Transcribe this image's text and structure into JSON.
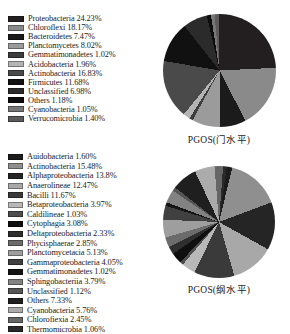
{
  "chart_data": [
    {
      "type": "pie",
      "title": "PGOS(门水平)",
      "categories": [
        "Proteobacteria",
        "Chloroflexi",
        "Bacteroidetes",
        "Planctomycetes",
        "Gemmatimonadetes",
        "Acidobacteria",
        "Actinobacteria",
        "Firmicutes",
        "Unclassified",
        "Others",
        "Cyanobacteria",
        "Verrucomicrobia"
      ],
      "values": [
        24.23,
        18.17,
        7.47,
        8.02,
        1.02,
        1.96,
        16.83,
        11.68,
        6.98,
        1.18,
        1.05,
        1.4
      ],
      "unit": "%",
      "colors": [
        "#231f20",
        "#8a8a8a",
        "#1b1b1b",
        "#9b9b9b",
        "#3d3d3d",
        "#b4b4b4",
        "#4a4a4a",
        "#111111",
        "#2b2b2b",
        "#0d0d0d",
        "#777777",
        "#5a5a5a"
      ],
      "legend_entries": [
        {
          "label": "Proteobacteria 24.23%",
          "color": "#231f20"
        },
        {
          "label": "Chloroflexi 18.17%",
          "color": "#8a8a8a"
        },
        {
          "label": "Bacteroidetes 7.47%",
          "color": "#1b1b1b"
        },
        {
          "label": "Planctomycetes 8.02%",
          "color": "#9b9b9b"
        },
        {
          "label": "Gemmatimonadetes 1.02%",
          "color": "#3d3d3d"
        },
        {
          "label": "Acidobacteria 1.96%",
          "color": "#b4b4b4"
        },
        {
          "label": "Actinobacteria 16.83%",
          "color": "#4a4a4a"
        },
        {
          "label": "Firmicutes 11.68%",
          "color": "#111111"
        },
        {
          "label": "Unclassified 6.98%",
          "color": "#2b2b2b"
        },
        {
          "label": "Others 1.18%",
          "color": "#0d0d0d"
        },
        {
          "label": "Cyanobacteria 1.05%",
          "color": "#777777"
        },
        {
          "label": "Verrucomicrobia 1.40%",
          "color": "#5a5a5a"
        }
      ],
      "legend_position": "left"
    },
    {
      "type": "pie",
      "title": "PGOS(纲水平)",
      "categories": [
        "Auidobacteria",
        "Actinobacteria",
        "Alphaproteobacteria",
        "Anaerolineae",
        "Bacilli",
        "Betaproteobacteria",
        "Caldilineae",
        "Cytophagia",
        "Deltaproteobacteria",
        "Phycisphaerae",
        "Planctomycetacia",
        "Gammaproteobacteria",
        "Gemmatimonadetes",
        "Sphingobacteriia",
        "Unclassified",
        "Others",
        "Cyanobacteria",
        "Chlorofiexia",
        "Thermomicrobia"
      ],
      "values": [
        1.6,
        15.48,
        13.8,
        12.47,
        11.67,
        3.97,
        1.03,
        3.08,
        2.33,
        2.85,
        5.13,
        4.05,
        1.02,
        3.79,
        1.12,
        7.33,
        5.76,
        2.45,
        1.06
      ],
      "unit": "%",
      "colors": [
        "#1c1c1c",
        "#8f8f8f",
        "#252525",
        "#a8a8a8",
        "#3a3a3a",
        "#b8b8b8",
        "#4d4d4d",
        "#0f0f0f",
        "#2e2e2e",
        "#6b6b6b",
        "#9e9e9e",
        "#404040",
        "#141414",
        "#828282",
        "#555555",
        "#1f1f1f",
        "#ababab",
        "#666666",
        "#2a2a2a"
      ],
      "legend_entries": [
        {
          "label": "Auidobacteria 1.60%",
          "color": "#1c1c1c"
        },
        {
          "label": "Actinobacteria 15.48%",
          "color": "#8f8f8f"
        },
        {
          "label": "Alphaproteobacteria 13.8%",
          "color": "#252525"
        },
        {
          "label": "Anaerolineae 12.47%",
          "color": "#a8a8a8"
        },
        {
          "label": "Bacilli 11.67%",
          "color": "#3a3a3a"
        },
        {
          "label": "Betaproteobacteria 3.97%",
          "color": "#b8b8b8"
        },
        {
          "label": "Caldilineae 1.03%",
          "color": "#4d4d4d"
        },
        {
          "label": "Cytophagia 3.08%",
          "color": "#0f0f0f"
        },
        {
          "label": "Deltaproteobacteria 2.33%",
          "color": "#2e2e2e"
        },
        {
          "label": "Phycisphaerae 2.85%",
          "color": "#6b6b6b"
        },
        {
          "label": "Planctomycetacia 5.13%",
          "color": "#9e9e9e"
        },
        {
          "label": "Gammaproteobacteria 4.05%",
          "color": "#404040"
        },
        {
          "label": "Gemmatimonadetes 1.02%",
          "color": "#141414"
        },
        {
          "label": "Sphingobacteriia 3.79%",
          "color": "#828282"
        },
        {
          "label": "Unclassified 1.12%",
          "color": "#555555"
        },
        {
          "label": "Others 7.33%",
          "color": "#1f1f1f"
        },
        {
          "label": "Cyanobacteria 5.76%",
          "color": "#ababab"
        },
        {
          "label": "Chlorofiexia 2.45%",
          "color": "#666666"
        },
        {
          "label": "Thermomicrobia 1.06%",
          "color": "#2a2a2a"
        }
      ],
      "legend_position": "left"
    }
  ]
}
